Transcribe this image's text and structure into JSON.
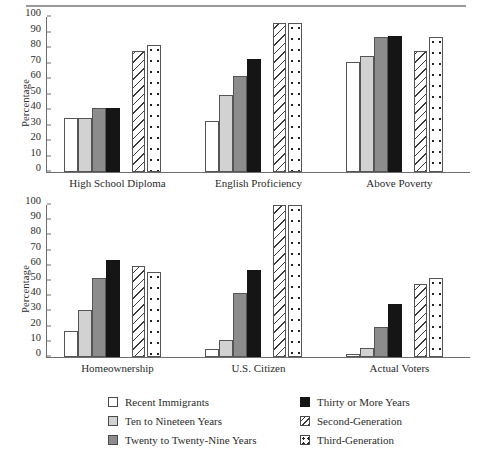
{
  "figure": {
    "has_top_rule": true,
    "background": "#ffffff"
  },
  "legend": {
    "left_column": [
      {
        "label": "Recent Immigrants",
        "style": "s-white",
        "swatch_name": "swatch-recent-immigrants"
      },
      {
        "label": "Ten to Nineteen Years",
        "style": "s-light",
        "swatch_name": "swatch-ten-to-nineteen-years"
      },
      {
        "label": "Twenty to Twenty-Nine Years",
        "style": "s-mid",
        "swatch_name": "swatch-twenty-to-twenty-nine-years"
      }
    ],
    "right_column": [
      {
        "label": "Thirty or More Years",
        "style": "s-black",
        "swatch_name": "swatch-thirty-or-more-years"
      },
      {
        "label": "Second-Generation",
        "style": "s-hatch",
        "swatch_name": "swatch-second-generation"
      },
      {
        "label": "Third-Generation",
        "style": "s-dot",
        "swatch_name": "swatch-third-generation"
      }
    ]
  },
  "chart_data": [
    {
      "type": "bar",
      "panel": "top",
      "title": "",
      "xlabel": "",
      "ylabel": "Percentage",
      "ylim": [
        0,
        100
      ],
      "yticks": [
        0,
        10,
        20,
        30,
        40,
        50,
        60,
        70,
        80,
        90,
        100
      ],
      "grid": false,
      "legend_position": "below-figure",
      "categories": [
        "High School Diploma",
        "English Proficiency",
        "Above Poverty"
      ],
      "series": [
        {
          "name": "Recent Immigrants",
          "style": "s-white",
          "values": [
            35,
            33,
            71
          ]
        },
        {
          "name": "Ten to Nineteen Years",
          "style": "s-light",
          "values": [
            35,
            50,
            75
          ]
        },
        {
          "name": "Twenty to Twenty-Nine Years",
          "style": "s-mid",
          "values": [
            41,
            62,
            87
          ]
        },
        {
          "name": "Thirty or More Years",
          "style": "s-black",
          "values": [
            41,
            73,
            88
          ]
        },
        {
          "name": "Second-Generation",
          "style": "s-hatch",
          "values": [
            78,
            96,
            78
          ]
        },
        {
          "name": "Third-Generation",
          "style": "s-dot",
          "values": [
            82,
            96,
            87
          ]
        }
      ]
    },
    {
      "type": "bar",
      "panel": "bottom",
      "title": "",
      "xlabel": "",
      "ylabel": "Percentage",
      "ylim": [
        0,
        100
      ],
      "yticks": [
        0,
        10,
        20,
        30,
        40,
        50,
        60,
        70,
        80,
        90,
        100
      ],
      "grid": false,
      "legend_position": "below-figure",
      "categories": [
        "Homeownership",
        "U.S. Citizen",
        "Actual Voters"
      ],
      "series": [
        {
          "name": "Recent Immigrants",
          "style": "s-white",
          "values": [
            17,
            5,
            2
          ]
        },
        {
          "name": "Ten to Nineteen Years",
          "style": "s-light",
          "values": [
            31,
            11,
            6
          ]
        },
        {
          "name": "Twenty to Twenty-Nine Years",
          "style": "s-mid",
          "values": [
            52,
            42,
            20
          ]
        },
        {
          "name": "Thirty or More Years",
          "style": "s-black",
          "values": [
            64,
            57,
            35
          ]
        },
        {
          "name": "Second-Generation",
          "style": "s-hatch",
          "values": [
            60,
            100,
            48
          ]
        },
        {
          "name": "Third-Generation",
          "style": "s-dot",
          "values": [
            56,
            100,
            52
          ]
        }
      ]
    }
  ]
}
